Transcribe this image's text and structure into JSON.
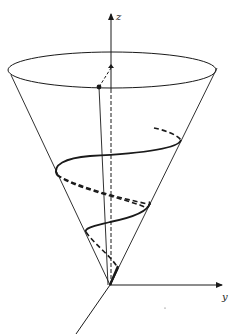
{
  "figure": {
    "axes": {
      "z_label": "z",
      "y_label": "y",
      "x_label": ""
    },
    "colors": {
      "ink": "#1a1a1a",
      "background": "#ffffff"
    }
  }
}
